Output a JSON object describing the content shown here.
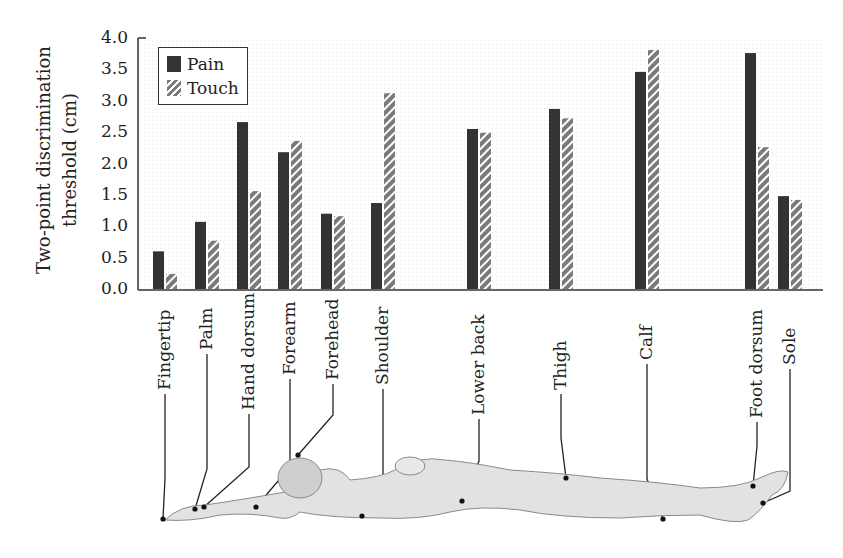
{
  "chart_data": {
    "type": "bar",
    "title": "",
    "xlabel": "",
    "ylabel": "Two-point discrimination threshold (cm)",
    "ylabel_lines": [
      "Two-point discrimination",
      "threshold (cm)"
    ],
    "ylim": [
      0,
      4.0
    ],
    "yticks": [
      "0.0",
      "0.5",
      "1.0",
      "1.5",
      "2.0",
      "2.5",
      "3.0",
      "3.5",
      "4.0"
    ],
    "grid": false,
    "legend_position": "upper-left",
    "categories": [
      "Fingertip",
      "Palm",
      "Hand dorsum",
      "Forearm",
      "Forehead",
      "Shoulder",
      "Lower back",
      "Thigh",
      "Calf",
      "Foot dorsum",
      "Sole"
    ],
    "series": [
      {
        "name": "Pain",
        "style": "solid",
        "color": "#333333",
        "values": [
          0.6,
          1.07,
          2.66,
          2.18,
          1.2,
          1.37,
          2.55,
          2.87,
          3.46,
          3.76,
          1.48
        ]
      },
      {
        "name": "Touch",
        "style": "hatched",
        "color": "#777777",
        "values": [
          0.24,
          0.77,
          1.56,
          2.36,
          1.16,
          3.12,
          2.49,
          2.72,
          3.81,
          2.26,
          1.42
        ]
      }
    ],
    "annotations": "Illustration of reclining human body below the axis with leader lines connecting each category label to the corresponding body location"
  },
  "figure": {
    "legend": {
      "pain": "Pain",
      "touch": "Touch"
    },
    "illustration": "reclining-human-body"
  }
}
